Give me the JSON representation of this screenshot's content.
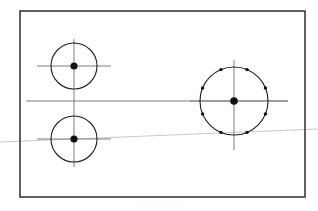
{
  "document": {
    "title": "Engineering Part Drawing",
    "type": "mechanical-technical-drawing",
    "background_color": "#ffffff",
    "caption_text": "··   ··  ·····      ··     ···"
  },
  "drawing": {
    "canvas": {
      "width": 318,
      "height": 211
    },
    "frame": {
      "label": "drawing-border-frame",
      "x": 20,
      "y": 11,
      "width": 285,
      "height": 186,
      "stroke_color": "#3a3a3c",
      "stroke_width": 1.6,
      "fill": "none"
    },
    "line_colors": {
      "centerline": "#7d7d82",
      "outline": "#1f1f22",
      "construction": "#c2c2c6"
    },
    "circles": [
      {
        "name": "upper-left-hole",
        "cx": 74,
        "cy": 66,
        "r": 23,
        "stroke_color": "#1f1f22",
        "stroke_width": 1.1,
        "center_dot_r": 3.6,
        "center_dot_color": "#111114"
      },
      {
        "name": "lower-left-hole",
        "cx": 74,
        "cy": 139,
        "r": 23,
        "stroke_color": "#1f1f22",
        "stroke_width": 1.1,
        "center_dot_r": 3.6,
        "center_dot_color": "#111114"
      },
      {
        "name": "right-bolt-circle",
        "cx": 234,
        "cy": 101,
        "r": 34,
        "stroke_color": "#1f1f22",
        "stroke_width": 1.1,
        "center_dot_r": 3.8,
        "center_dot_color": "#111114"
      }
    ],
    "bolt_holes": {
      "name": "bolt-hole-pattern",
      "host_circle": "right-bolt-circle",
      "count": 8,
      "dot_radius": 1.7,
      "dot_color": "#111114",
      "pattern_radius": 34,
      "start_angle_deg": 22.5,
      "step_angle_deg": 45,
      "angles_deg": [
        22.5,
        67.5,
        112.5,
        157.5,
        202.5,
        247.5,
        292.5,
        337.5
      ]
    },
    "centerlines": [
      {
        "name": "main-horizontal-centerline",
        "x1": 26,
        "y1": 101,
        "x2": 288,
        "y2": 101,
        "color": "#7d7d82",
        "width": 1.0
      },
      {
        "name": "left-vertical-centerline",
        "x1": 74,
        "y1": 39,
        "x2": 74,
        "y2": 167,
        "color": "#7d7d82",
        "width": 1.0
      },
      {
        "name": "upper-left-horizontal-centerline",
        "x1": 37,
        "y1": 66,
        "x2": 111,
        "y2": 66,
        "color": "#7d7d82",
        "width": 1.0
      },
      {
        "name": "lower-left-horizontal-centerline",
        "x1": 37,
        "y1": 139,
        "x2": 111,
        "y2": 139,
        "color": "#7d7d82",
        "width": 1.0
      },
      {
        "name": "right-vertical-centerline",
        "x1": 234,
        "y1": 60,
        "x2": 234,
        "y2": 150,
        "color": "#7d7d82",
        "width": 1.0
      },
      {
        "name": "right-horizontal-centerline",
        "x1": 190,
        "y1": 101,
        "x2": 288,
        "y2": 101,
        "color": "#7d7d82",
        "width": 1.0
      }
    ],
    "construction_line": {
      "name": "faint-diagonal-construction-line",
      "x1": 0,
      "y1": 142,
      "x2": 318,
      "y2": 129,
      "color": "#c2c2c6",
      "width": 0.9,
      "description": "faint light-gray line crossing full image width, sloping slightly upward to the right, extending past the frame on both sides"
    }
  }
}
